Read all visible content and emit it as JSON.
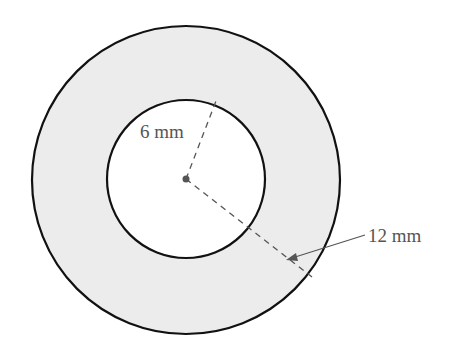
{
  "diagram": {
    "type": "annulus",
    "fill_color": "#ececec",
    "stroke_color": "#111111",
    "inner_radius_label": "6 mm",
    "outer_radius_label": "12 mm"
  }
}
